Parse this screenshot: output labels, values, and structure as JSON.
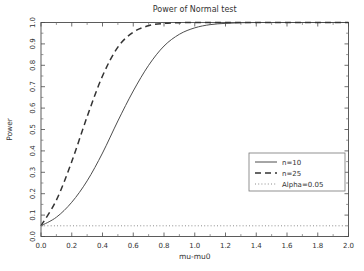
{
  "chart_data": {
    "type": "line",
    "title": "Power of Normal test",
    "xlabel": "mu-mu0",
    "ylabel": "Power",
    "xlim": [
      0.0,
      2.0
    ],
    "ylim": [
      0.0,
      1.0
    ],
    "grid": false,
    "legend_position": "center-right",
    "xticks": [
      "0.0",
      "0.2",
      "0.4",
      "0.6",
      "0.8",
      "1.0",
      "1.2",
      "1.4",
      "1.6",
      "1.8",
      "2.0"
    ],
    "xtick_values": [
      0.0,
      0.2,
      0.4,
      0.6,
      0.8,
      1.0,
      1.2,
      1.4,
      1.6,
      1.8,
      2.0
    ],
    "yticks": [
      "0.0",
      "0.1",
      "0.2",
      "0.3",
      "0.4",
      "0.5",
      "0.6",
      "0.7",
      "0.8",
      "0.9",
      "1.0"
    ],
    "ytick_values": [
      0.0,
      0.1,
      0.2,
      0.3,
      0.4,
      0.5,
      0.6,
      0.7,
      0.8,
      0.9,
      1.0
    ],
    "x": [
      0.0,
      0.1,
      0.2,
      0.3,
      0.4,
      0.5,
      0.6,
      0.7,
      0.8,
      0.9,
      1.0,
      1.1,
      1.2,
      1.3,
      1.4,
      1.5,
      1.6,
      1.7,
      1.8,
      1.9,
      2.0
    ],
    "series": [
      {
        "name": "n=10",
        "style": "solid",
        "color": "#4d4d4d",
        "values": [
          0.05,
          0.09,
          0.16,
          0.26,
          0.39,
          0.54,
          0.68,
          0.8,
          0.89,
          0.945,
          0.975,
          0.99,
          0.996,
          0.999,
          1.0,
          1.0,
          1.0,
          1.0,
          1.0,
          1.0,
          1.0
        ]
      },
      {
        "name": "n=25",
        "style": "dashed",
        "color": "#333333",
        "values": [
          0.05,
          0.17,
          0.35,
          0.56,
          0.75,
          0.885,
          0.955,
          0.985,
          0.996,
          0.999,
          1.0,
          1.0,
          1.0,
          1.0,
          1.0,
          1.0,
          1.0,
          1.0,
          1.0,
          1.0,
          1.0
        ]
      },
      {
        "name": "Alpha=0.05",
        "style": "dotted",
        "color": "#8c8c8c",
        "constant": 0.05,
        "values": [
          0.05,
          0.05,
          0.05,
          0.05,
          0.05,
          0.05,
          0.05,
          0.05,
          0.05,
          0.05,
          0.05,
          0.05,
          0.05,
          0.05,
          0.05,
          0.05,
          0.05,
          0.05,
          0.05,
          0.05,
          0.05
        ]
      }
    ]
  },
  "legend": {
    "entries": [
      {
        "label": "n=10"
      },
      {
        "label": "n=25"
      },
      {
        "label": "Alpha=0.05"
      }
    ]
  }
}
